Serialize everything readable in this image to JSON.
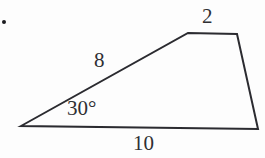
{
  "figure": {
    "kind": "quadrilateral-diagram",
    "background_color": "#fdfdfd",
    "stroke_color": "#2b2b30",
    "text_color": "#2f2f33",
    "stroke_width": 2,
    "bullet": {
      "name": "bullet-dot",
      "color": "#1b1b1f"
    },
    "vertices": [
      {
        "name": "apex-left",
        "x": 21,
        "y": 126
      },
      {
        "name": "top-left",
        "x": 188,
        "y": 33
      },
      {
        "name": "top-right",
        "x": 237,
        "y": 34
      },
      {
        "name": "bottom-right",
        "x": 258,
        "y": 129
      }
    ],
    "polygon_points": "21,126 188,33 237,34 258,129",
    "labels": {
      "top_side": "2",
      "slant_side": "8",
      "angle": "30°",
      "base_side": "10"
    }
  }
}
